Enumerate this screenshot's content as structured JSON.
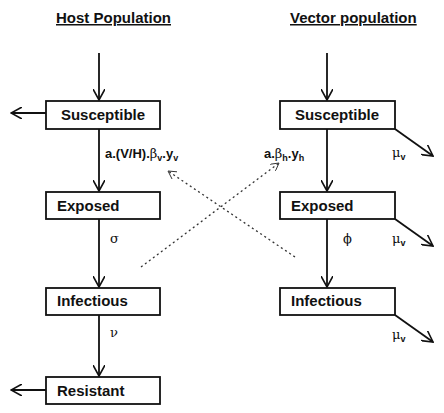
{
  "host": {
    "title": "Host Population",
    "compartments": [
      "Susceptible",
      "Exposed",
      "Infectious",
      "Resistant"
    ],
    "rates": {
      "infection_prefix": "a.(V/H).",
      "infection_beta": "β",
      "infection_beta_sub": "v",
      "infection_dot": ".",
      "infection_y": "y",
      "infection_y_sub": "v",
      "incubation": "σ",
      "recovery": "ν"
    }
  },
  "vector": {
    "title": "Vector population",
    "compartments": [
      "Susceptible",
      "Exposed",
      "Infectious"
    ],
    "rates": {
      "infection_prefix": "a.",
      "infection_beta": "β",
      "infection_beta_sub": "h",
      "infection_dot": ".",
      "infection_y": "y",
      "infection_y_sub": "h",
      "incubation": "ϕ",
      "mortality": "μ",
      "mortality_sub": "v"
    }
  },
  "colors": {
    "stroke": "#111111",
    "background": "#ffffff"
  }
}
